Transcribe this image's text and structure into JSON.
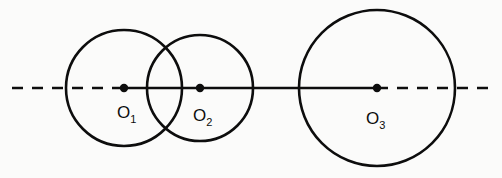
{
  "figure": {
    "name": "three-circles-on-axis",
    "background_color": "#fbfbfa",
    "ink_color": "#0d0d0d",
    "width": 502,
    "height": 178
  },
  "axis": {
    "name": "horizontal-center-axis",
    "y": 88,
    "stroke_width": 2.6,
    "dash_pattern": "11 9",
    "segments": [
      {
        "id": "left-dash",
        "x1": 12,
        "x2": 124,
        "style": "dashed"
      },
      {
        "id": "center-solid",
        "x1": 124,
        "x2": 377,
        "style": "solid"
      },
      {
        "id": "right-dash",
        "x1": 377,
        "x2": 492,
        "style": "dashed"
      }
    ]
  },
  "circles": [
    {
      "id": "circle-1",
      "label": "O",
      "subscript": "1",
      "cx": 124,
      "cy": 88,
      "r": 58,
      "stroke_width": 2.6,
      "label_x": 117,
      "label_y": 118
    },
    {
      "id": "circle-2",
      "label": "O",
      "subscript": "2",
      "cx": 200,
      "cy": 88,
      "r": 53,
      "stroke_width": 2.6,
      "label_x": 193,
      "label_y": 121
    },
    {
      "id": "circle-3",
      "label": "O",
      "subscript": "3",
      "cx": 377,
      "cy": 88,
      "r": 78,
      "stroke_width": 2.6,
      "label_x": 366,
      "label_y": 124
    }
  ],
  "center_dots": [
    {
      "id": "dot-o1",
      "cx": 124,
      "cy": 88,
      "r": 4.2
    },
    {
      "id": "dot-o2",
      "cx": 200,
      "cy": 88,
      "r": 4.2
    },
    {
      "id": "dot-o3",
      "cx": 377,
      "cy": 88,
      "r": 4.2
    }
  ],
  "labels": {
    "o1": "O",
    "o1_sub": "1",
    "o2": "O",
    "o2_sub": "2",
    "o3": "O",
    "o3_sub": "3"
  }
}
